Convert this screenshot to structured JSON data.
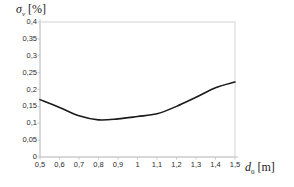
{
  "chart_data": {
    "type": "line",
    "title": "",
    "ylabel": "σv [%]",
    "ylabel_symbol": "σ",
    "ylabel_sub": "v",
    "ylabel_unit": "[%]",
    "xlabel": "d0 [m]",
    "xlabel_symbol": "d",
    "xlabel_sub": "0",
    "xlabel_unit": "[m]",
    "xlim": [
      0.5,
      1.5
    ],
    "ylim": [
      0,
      0.4
    ],
    "grid": false,
    "legend": null,
    "decimal_separator": ",",
    "xticks": [
      0.5,
      0.6,
      0.7,
      0.8,
      0.9,
      1.0,
      1.1,
      1.2,
      1.3,
      1.4,
      1.5
    ],
    "xtick_labels": [
      "0,5",
      "0,6",
      "0,7",
      "0,8",
      "0,9",
      "1",
      "1,1",
      "1,2",
      "1,3",
      "1,4",
      "1,5"
    ],
    "yticks": [
      0,
      0.05,
      0.1,
      0.15,
      0.2,
      0.25,
      0.3,
      0.35,
      0.4
    ],
    "ytick_labels": [
      "0",
      "0,05",
      "0,1",
      "0,15",
      "0,2",
      "0,25",
      "0,3",
      "0,35",
      "0,4"
    ],
    "series": [
      {
        "name": "sigma_v",
        "color": "#1a1a1a",
        "linewidth": 1.6,
        "x": [
          0.5,
          0.6,
          0.7,
          0.8,
          0.9,
          1.0,
          1.1,
          1.2,
          1.3,
          1.4,
          1.5
        ],
        "values": [
          0.17,
          0.147,
          0.122,
          0.11,
          0.113,
          0.12,
          0.128,
          0.15,
          0.177,
          0.205,
          0.222
        ]
      }
    ],
    "axis_color": "#c8c8c8",
    "frame_color": "#d4d4d4",
    "background": "#ffffff"
  }
}
